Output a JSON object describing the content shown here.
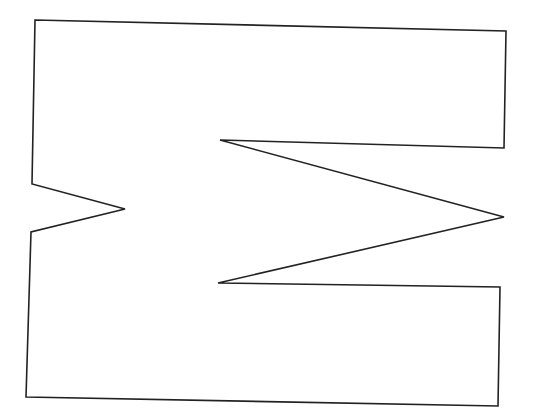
{
  "figure": {
    "stroke_color": "#222222",
    "background": "#ffffff",
    "stroke_width": 1.6,
    "points": "35,20 506,31 504,148 220,140 504,217 218,283 500,287 498,406 26,397 31,232 125,209 32,184"
  }
}
